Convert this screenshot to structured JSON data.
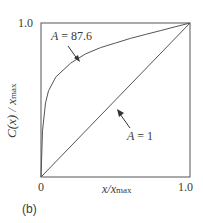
{
  "chart_data": {
    "type": "line",
    "title": "",
    "panel_label": "(b)",
    "xlabel": "x/x_max",
    "ylabel": "C(x) / x_max",
    "xlim": [
      0,
      1.0
    ],
    "ylim": [
      0,
      1.0
    ],
    "x_tick_labels": [
      "0",
      "1.0"
    ],
    "y_tick_labels": [
      "1.0"
    ],
    "grid": false,
    "series": [
      {
        "name": "A = 87.6",
        "x": [
          0,
          0.01,
          0.03,
          0.05,
          0.1,
          0.2,
          0.3,
          0.4,
          0.5,
          0.6,
          0.7,
          0.8,
          0.9,
          1.0
        ],
        "values": [
          0,
          0.3,
          0.48,
          0.56,
          0.65,
          0.74,
          0.8,
          0.84,
          0.87,
          0.9,
          0.925,
          0.95,
          0.975,
          1.0
        ]
      },
      {
        "name": "A = 1",
        "x": [
          0,
          1.0
        ],
        "values": [
          0,
          1.0
        ]
      }
    ],
    "annotations": [
      {
        "text": "A = 87.6",
        "arrow_to": [
          0.26,
          0.77
        ]
      },
      {
        "text": "A = 1",
        "arrow_to": [
          0.5,
          0.5
        ]
      }
    ]
  },
  "labels": {
    "y_top": "1.0",
    "x_zero": "0",
    "x_one": "1.0",
    "x_axis_main": "x/x",
    "x_axis_sub": "max",
    "y_axis_main": "C(x) / x",
    "y_axis_sub": "max",
    "annotation_a1_var": "A",
    "annotation_a1_val": " = 87.6",
    "annotation_a2_var": "A",
    "annotation_a2_val": " = 1",
    "panel": "(b)"
  }
}
